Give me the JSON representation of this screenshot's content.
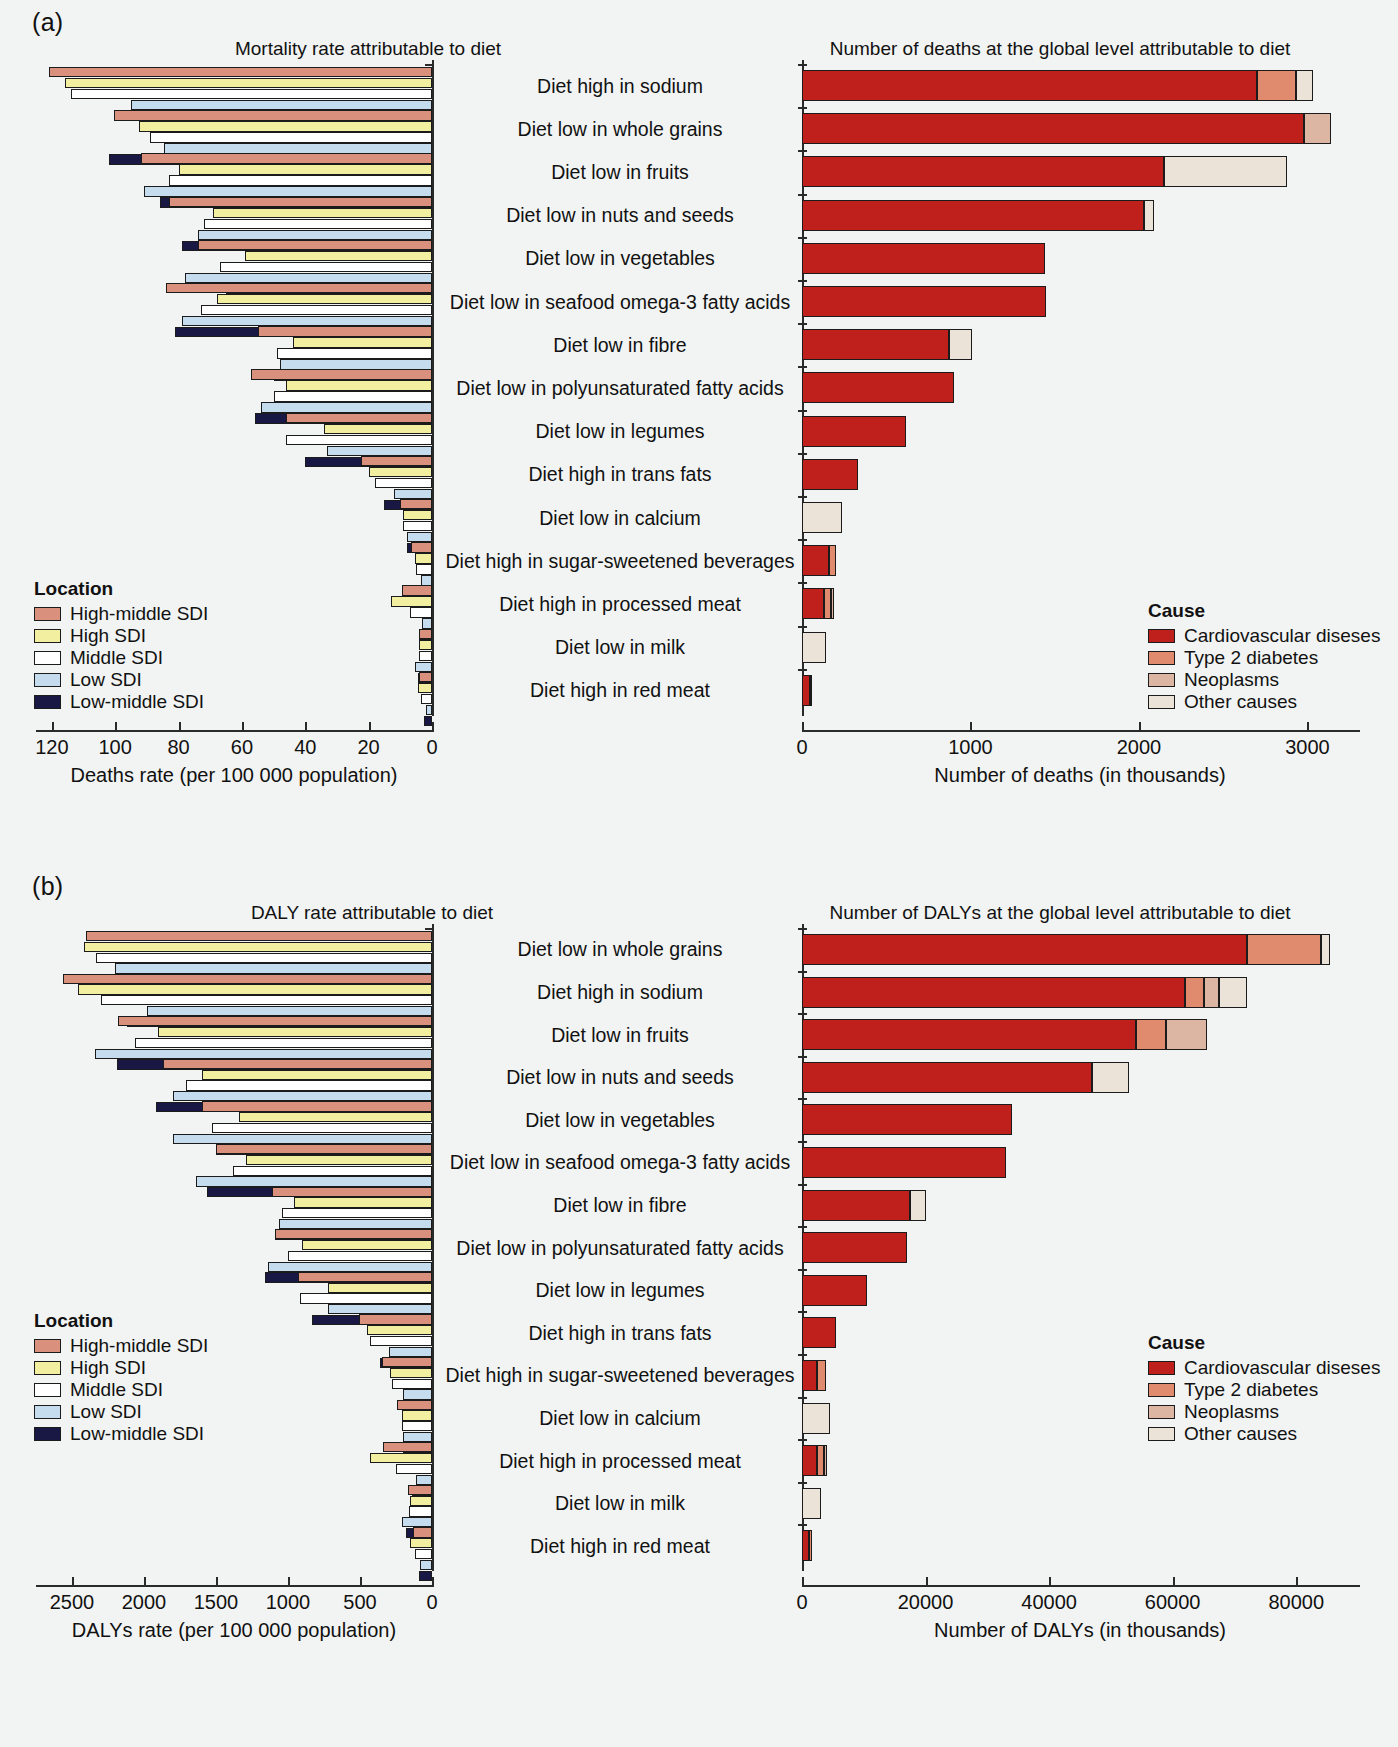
{
  "figure": {
    "panels": [
      {
        "letter": "(a)"
      },
      {
        "letter": "(b)"
      }
    ]
  },
  "panel_a": {
    "letter": "(a)",
    "left_title": "Mortality rate attributable to diet",
    "right_title": "Number of deaths at the global level attributable to diet",
    "left_axis_caption": "Deaths rate (per 100 000 population)",
    "right_axis_caption": "Number of deaths (in thousands)",
    "left_ticks": [
      "120",
      "100",
      "80",
      "60",
      "40",
      "20",
      "0"
    ],
    "right_ticks": [
      "0",
      "1000",
      "2000",
      "3000"
    ],
    "location_legend": {
      "title": "Location",
      "items": [
        {
          "label": "High-middle SDI",
          "color": "#d9907c"
        },
        {
          "label": "High SDI",
          "color": "#f2f0a0"
        },
        {
          "label": "Middle SDI",
          "color": "#ffffff"
        },
        {
          "label": "Low SDI",
          "color": "#c5dcef"
        },
        {
          "label": "Low-middle SDI",
          "color": "#191844"
        }
      ]
    },
    "cause_legend": {
      "title": "Cause",
      "items": [
        {
          "label": "Cardiovascular diseses",
          "color": "#c0201c"
        },
        {
          "label": "Type 2 diabetes",
          "color": "#e08a6e"
        },
        {
          "label": "Neoplasms",
          "color": "#dcb5a3"
        },
        {
          "label": "Other causes",
          "color": "#ece3d8"
        }
      ]
    }
  },
  "panel_b": {
    "letter": "(b)",
    "left_title": "DALY rate attributable to diet",
    "right_title": "Number of DALYs at the global level attributable to diet",
    "left_axis_caption": "DALYs rate (per 100 000 population)",
    "right_axis_caption": "Number of DALYs (in thousands)",
    "left_ticks": [
      "2500",
      "2000",
      "1500",
      "1000",
      "500",
      "0"
    ],
    "right_ticks": [
      "0",
      "20 000",
      "40 000",
      "60 000",
      "80 000"
    ],
    "location_legend": {
      "title": "Location",
      "items": [
        {
          "label": "High-middle SDI",
          "color": "#d9907c"
        },
        {
          "label": "High SDI",
          "color": "#f2f0a0"
        },
        {
          "label": "Middle SDI",
          "color": "#ffffff"
        },
        {
          "label": "Low SDI",
          "color": "#c5dcef"
        },
        {
          "label": "Low-middle SDI",
          "color": "#191844"
        }
      ]
    },
    "cause_legend": {
      "title": "Cause",
      "items": [
        {
          "label": "Cardiovascular diseses",
          "color": "#c0201c"
        },
        {
          "label": "Type 2 diabetes",
          "color": "#e08a6e"
        },
        {
          "label": "Neoplasms",
          "color": "#dcb5a3"
        },
        {
          "label": "Other causes",
          "color": "#ece3d8"
        }
      ]
    }
  },
  "chart_data": [
    {
      "id": "a-left",
      "type": "bar",
      "orientation": "horizontal-reversed",
      "title": "Mortality rate attributable to diet",
      "xlabel": "Deaths rate (per 100 000 population)",
      "ylabel": "",
      "xlim": [
        0,
        125
      ],
      "xticks": [
        120,
        100,
        80,
        60,
        40,
        20,
        0
      ],
      "grid": false,
      "legend": "Location",
      "categories": [
        "Diet high in sodium",
        "Diet low in whole grains",
        "Diet low in fruits",
        "Diet low in nuts and seeds",
        "Diet low in vegetables",
        "Diet low in seafood omega-3 fatty acids",
        "Diet low in fibre",
        "Diet low in polyunsaturated fatty acids",
        "Diet low in legumes",
        "Diet high in trans fats",
        "Diet low in calcium",
        "Diet high in sugar-sweetened beverages",
        "Diet high in processed meat",
        "Diet low in milk",
        "Diet high in red meat"
      ],
      "series": [
        {
          "name": "High-middle SDI",
          "color": "#d9907c",
          "values": [
            121.0,
            100.5,
            92.0,
            83.0,
            74.0,
            84.0,
            55.0,
            57.0,
            46.0,
            22.5,
            10.0,
            6.5,
            9.5,
            4.0,
            4.0
          ]
        },
        {
          "name": "High SDI",
          "color": "#f2f0a0",
          "values": [
            116.0,
            92.5,
            80.0,
            69.0,
            59.0,
            68.0,
            44.0,
            46.0,
            34.0,
            20.0,
            9.0,
            5.5,
            13.0,
            4.0,
            4.5
          ]
        },
        {
          "name": "Middle SDI",
          "color": "#ffffff",
          "values": [
            114.0,
            89.0,
            83.0,
            72.0,
            67.0,
            73.0,
            49.0,
            50.0,
            46.0,
            18.0,
            9.0,
            5.0,
            7.0,
            4.0,
            3.5
          ]
        },
        {
          "name": "Low SDI",
          "color": "#c5dcef",
          "values": [
            95.0,
            84.5,
            91.0,
            74.0,
            78.0,
            79.0,
            48.0,
            54.0,
            33.0,
            12.0,
            8.0,
            3.5,
            3.0,
            5.5,
            2.0
          ]
        },
        {
          "name": "Low-middle SDI",
          "color": "#191844",
          "values": [
            76.0,
            102.0,
            86.0,
            79.0,
            65.0,
            81.0,
            50.0,
            56.0,
            40.0,
            15.0,
            8.0,
            4.0,
            4.0,
            4.5,
            2.5
          ]
        }
      ]
    },
    {
      "id": "a-right",
      "type": "stacked-bar",
      "orientation": "horizontal",
      "title": "Number of deaths at the global level attributable to diet",
      "xlabel": "Number of deaths (in thousands)",
      "ylabel": "",
      "xlim": [
        0,
        3300
      ],
      "xticks": [
        0,
        1000,
        2000,
        3000
      ],
      "grid": false,
      "legend": "Cause",
      "categories": [
        "Diet high in sodium",
        "Diet low in whole grains",
        "Diet low in fruits",
        "Diet low in nuts and seeds",
        "Diet low in vegetables",
        "Diet low in seafood omega-3 fatty acids",
        "Diet low in fibre",
        "Diet low in polyunsaturated fatty acids",
        "Diet low in legumes",
        "Diet high in trans fats",
        "Diet low in calcium",
        "Diet high in sugar-sweetened beverages",
        "Diet high in processed meat",
        "Diet low in milk",
        "Diet high in red meat"
      ],
      "series": [
        {
          "name": "Cardiovascular diseses",
          "color": "#c0201c",
          "values": [
            2700,
            2980,
            2150,
            2030,
            1440,
            1450,
            870,
            900,
            620,
            330,
            0,
            160,
            130,
            0,
            50
          ]
        },
        {
          "name": "Type 2 diabetes",
          "color": "#e08a6e",
          "values": [
            230,
            0,
            0,
            0,
            0,
            0,
            0,
            0,
            0,
            0,
            0,
            40,
            40,
            0,
            10
          ]
        },
        {
          "name": "Neoplasms",
          "color": "#dcb5a3",
          "values": [
            0,
            160,
            0,
            0,
            0,
            0,
            0,
            0,
            0,
            0,
            0,
            0,
            20,
            0,
            0
          ]
        },
        {
          "name": "Other causes",
          "color": "#ece3d8",
          "values": [
            100,
            0,
            730,
            60,
            0,
            0,
            140,
            0,
            0,
            0,
            240,
            0,
            0,
            140,
            0
          ]
        }
      ]
    },
    {
      "id": "b-left",
      "type": "bar",
      "orientation": "horizontal-reversed",
      "title": "DALY rate attributable to diet",
      "xlabel": "DALYs rate (per 100 000 population)",
      "ylabel": "",
      "xlim": [
        0,
        2750
      ],
      "xticks": [
        2500,
        2000,
        1500,
        1000,
        500,
        0
      ],
      "grid": false,
      "legend": "Location",
      "categories": [
        "Diet low in whole grains",
        "Diet high in sodium",
        "Diet low in fruits",
        "Diet low in nuts and seeds",
        "Diet low in vegetables",
        "Diet low in seafood omega-3 fatty acids",
        "Diet low in fibre",
        "Diet low in polyunsaturated fatty acids",
        "Diet low in legumes",
        "Diet high in trans fats",
        "Diet high in sugar-sweetened beverages",
        "Diet low in calcium",
        "Diet high in processed meat",
        "Diet low in milk",
        "Diet high in red meat"
      ],
      "series": [
        {
          "name": "High-middle SDI",
          "color": "#d9907c",
          "values": [
            2400,
            2560,
            2180,
            1870,
            1600,
            1500,
            1110,
            1090,
            930,
            510,
            350,
            240,
            340,
            170,
            130
          ]
        },
        {
          "name": "High SDI",
          "color": "#f2f0a0",
          "values": [
            2420,
            2460,
            1900,
            1600,
            1340,
            1290,
            960,
            900,
            720,
            450,
            290,
            210,
            430,
            150,
            150
          ]
        },
        {
          "name": "Middle SDI",
          "color": "#ffffff",
          "values": [
            2330,
            2300,
            2060,
            1710,
            1530,
            1380,
            1040,
            1000,
            920,
            430,
            280,
            210,
            250,
            160,
            120
          ]
        },
        {
          "name": "Low SDI",
          "color": "#c5dcef",
          "values": [
            2200,
            1980,
            2340,
            1800,
            1800,
            1640,
            1060,
            1140,
            720,
            300,
            200,
            200,
            110,
            210,
            80
          ]
        },
        {
          "name": "Low-middle SDI",
          "color": "#191844",
          "values": [
            2480,
            2120,
            2190,
            1920,
            1500,
            1560,
            1090,
            1160,
            830,
            360,
            230,
            200,
            140,
            180,
            90
          ]
        }
      ]
    },
    {
      "id": "b-right",
      "type": "stacked-bar",
      "orientation": "horizontal",
      "title": "Number of DALYs at the global level attributable to diet",
      "xlabel": "Number of DALYs (in thousands)",
      "ylabel": "",
      "xlim": [
        0,
        90000
      ],
      "xticks": [
        0,
        20000,
        40000,
        60000,
        80000
      ],
      "grid": false,
      "legend": "Cause",
      "categories": [
        "Diet low in whole grains",
        "Diet high in sodium",
        "Diet low in fruits",
        "Diet low in nuts and seeds",
        "Diet low in vegetables",
        "Diet low in seafood omega-3 fatty acids",
        "Diet low in fibre",
        "Diet low in polyunsaturated fatty acids",
        "Diet low in legumes",
        "Diet high in trans fats",
        "Diet high in sugar-sweetened beverages",
        "Diet low in calcium",
        "Diet high in processed meat",
        "Diet low in milk",
        "Diet high in red meat"
      ],
      "series": [
        {
          "name": "Cardiovascular diseses",
          "color": "#c0201c",
          "values": [
            72000,
            62000,
            54000,
            47000,
            34000,
            33000,
            17500,
            17000,
            10500,
            5500,
            2500,
            0,
            2500,
            0,
            1200
          ]
        },
        {
          "name": "Type 2 diabetes",
          "color": "#e08a6e",
          "values": [
            12000,
            3000,
            5000,
            0,
            0,
            0,
            0,
            0,
            0,
            0,
            1400,
            0,
            1000,
            0,
            400
          ]
        },
        {
          "name": "Neoplasms",
          "color": "#dcb5a3",
          "values": [
            0,
            2500,
            6500,
            0,
            0,
            0,
            0,
            0,
            0,
            0,
            0,
            0,
            600,
            0,
            0
          ]
        },
        {
          "name": "Other causes",
          "color": "#ece3d8",
          "values": [
            1500,
            4500,
            0,
            6000,
            0,
            0,
            2500,
            0,
            0,
            0,
            0,
            4500,
            0,
            3000,
            0
          ]
        }
      ]
    }
  ]
}
